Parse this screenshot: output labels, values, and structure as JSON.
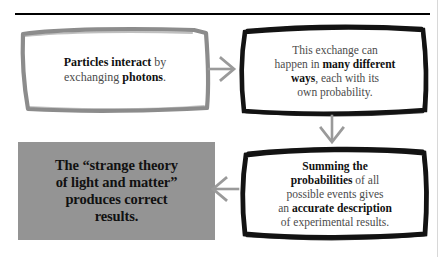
{
  "page": {
    "background_color": "#ffffff",
    "top_rule_color": "#000000",
    "ink_color": "#4b4b4b",
    "emphasis_color": "#111111",
    "sketch_dark_color": "#111111",
    "sketch_light_color": "#8c8c8c",
    "arrow_color": "#9a9a9a",
    "conclusion_fill_color": "#949494"
  },
  "diagram": {
    "title": "",
    "boxes": [
      {
        "id": "exchange",
        "style": "sketch-grey",
        "lines": [
          {
            "segments": [
              {
                "text": "Particles interact",
                "bold": true
              },
              {
                "text": " by",
                "bold": false
              }
            ]
          },
          {
            "segments": [
              {
                "text": "exchanging ",
                "bold": false
              },
              {
                "text": "photons",
                "bold": true
              },
              {
                "text": ".",
                "bold": false
              }
            ]
          }
        ],
        "plain_text": "Particles interact by exchanging photons."
      },
      {
        "id": "ways",
        "style": "sketch-black",
        "lines": [
          {
            "segments": [
              {
                "text": "This exchange can",
                "bold": false
              }
            ]
          },
          {
            "segments": [
              {
                "text": "happen in ",
                "bold": false
              },
              {
                "text": "many different",
                "bold": true
              }
            ]
          },
          {
            "segments": [
              {
                "text": "ways",
                "bold": true
              },
              {
                "text": ", each with its",
                "bold": false
              }
            ]
          },
          {
            "segments": [
              {
                "text": "own probability.",
                "bold": false
              }
            ]
          }
        ],
        "plain_text": "This exchange can happen in many different ways, each with its own probability."
      },
      {
        "id": "summing",
        "style": "sketch-black",
        "lines": [
          {
            "segments": [
              {
                "text": "Summing the",
                "bold": true
              }
            ]
          },
          {
            "segments": [
              {
                "text": "probabilities",
                "bold": true
              },
              {
                "text": " of all",
                "bold": false
              }
            ]
          },
          {
            "segments": [
              {
                "text": "possible events gives",
                "bold": false
              }
            ]
          },
          {
            "segments": [
              {
                "text": "an ",
                "bold": false
              },
              {
                "text": "accurate description",
                "bold": true
              }
            ]
          },
          {
            "segments": [
              {
                "text": "of experimental results.",
                "bold": false
              }
            ]
          }
        ],
        "plain_text": "Summing the probabilities of all possible events gives an accurate description of experimental results."
      },
      {
        "id": "conclusion",
        "style": "solid-grey",
        "lines": [
          {
            "segments": [
              {
                "text": "The “strange theory",
                "bold": true
              }
            ]
          },
          {
            "segments": [
              {
                "text": "of light and matter”",
                "bold": true
              }
            ]
          },
          {
            "segments": [
              {
                "text": "produces correct",
                "bold": true
              }
            ]
          },
          {
            "segments": [
              {
                "text": "results.",
                "bold": true
              }
            ]
          }
        ],
        "plain_text": "The “strange theory of light and matter” produces correct results."
      }
    ],
    "arrows": [
      {
        "id": "exchange-to-ways",
        "direction": "right",
        "from": "exchange",
        "to": "ways"
      },
      {
        "id": "ways-to-summing",
        "direction": "down",
        "from": "ways",
        "to": "summing"
      },
      {
        "id": "summing-to-conclusion",
        "direction": "left",
        "from": "summing",
        "to": "conclusion"
      }
    ]
  }
}
